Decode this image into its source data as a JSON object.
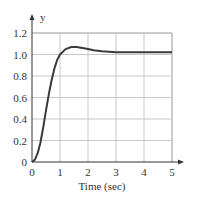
{
  "chart_data": {
    "type": "line",
    "title": "",
    "xlabel": "Time (sec)",
    "ylabel": "y",
    "xlim": [
      0,
      5
    ],
    "ylim": [
      0,
      1.2
    ],
    "x_ticks": [
      "0",
      "1",
      "2",
      "3",
      "4",
      "5"
    ],
    "y_ticks": [
      "0",
      "0.2",
      "0.4",
      "0.6",
      "0.8",
      "1.0",
      "1.2"
    ],
    "grid": true,
    "legend": null,
    "series": [
      {
        "name": "step response",
        "x": [
          0,
          0.1,
          0.2,
          0.3,
          0.4,
          0.5,
          0.6,
          0.7,
          0.8,
          0.9,
          1.0,
          1.2,
          1.4,
          1.6,
          1.8,
          2.0,
          2.2,
          2.5,
          3.0,
          3.5,
          4.0,
          4.5,
          5.0
        ],
        "values": [
          0,
          0.02,
          0.08,
          0.18,
          0.32,
          0.48,
          0.63,
          0.76,
          0.87,
          0.95,
          1.0,
          1.05,
          1.07,
          1.07,
          1.06,
          1.05,
          1.04,
          1.03,
          1.02,
          1.02,
          1.02,
          1.02,
          1.02
        ]
      }
    ]
  },
  "axes": {
    "x_label": "Time (sec)",
    "y_label": "y"
  },
  "colors": {
    "curve": "#3a3a3a",
    "grid": "#c8c8c8",
    "axis": "#333333"
  }
}
